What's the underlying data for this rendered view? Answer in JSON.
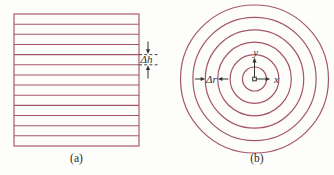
{
  "figure": {
    "colors": {
      "line_color": "#a4566a",
      "annotation_color": "#333333",
      "background": "#fdfdfc"
    },
    "panel_a": {
      "label": "(a)",
      "dimension_label": "Δh",
      "square": {
        "x": 14,
        "y": 14,
        "width": 125,
        "height": 132
      },
      "inner_line_count": 12,
      "dimension_between_lines": [
        4,
        5
      ]
    },
    "panel_b": {
      "label": "(b)",
      "dimension_label": "Δr",
      "axis_labels": {
        "x": "x",
        "y": "y"
      },
      "center": {
        "x": 254.5,
        "y": 79
      },
      "circle_radii": [
        12,
        24.4,
        36.8,
        49.2,
        61.6,
        74
      ]
    }
  }
}
